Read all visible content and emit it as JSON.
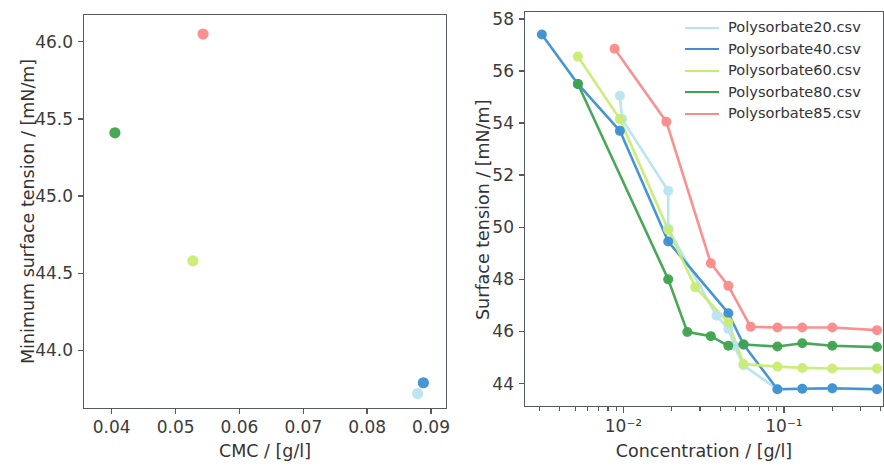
{
  "figure": {
    "background": "#ffffff",
    "axis_color": "#555a5e",
    "text_color": "#333333"
  },
  "series_colors": {
    "Polysorbate20": "#b8e4f0",
    "Polysorbate40": "#3d8fd1",
    "Polysorbate60": "#c8ec72",
    "Polysorbate80": "#3fa34d",
    "Polysorbate85": "#f98b8b"
  },
  "left_panel": {
    "x_title": "CMC / [g/l]",
    "y_title": "Minimum surface tension / [mN/m]",
    "x_ticks": [
      "0.04",
      "0.05",
      "0.06",
      "0.07",
      "0.08",
      "0.09"
    ],
    "y_ticks": [
      "44.0",
      "44.5",
      "45.0",
      "45.5",
      "46.0"
    ]
  },
  "right_panel": {
    "x_title": "Concentration / [g/l]",
    "y_title": "Surface tension / [mN/m]",
    "x_ticks": [
      "10⁻²",
      "10⁻¹"
    ],
    "y_ticks": [
      "44",
      "46",
      "48",
      "50",
      "52",
      "54",
      "56",
      "58"
    ],
    "legend": [
      {
        "label": "Polysorbate20.csv",
        "color": "#b8e4f0"
      },
      {
        "label": "Polysorbate40.csv",
        "color": "#3d8fd1"
      },
      {
        "label": "Polysorbate60.csv",
        "color": "#c8ec72"
      },
      {
        "label": "Polysorbate80.csv",
        "color": "#3fa34d"
      },
      {
        "label": "Polysorbate85.csv",
        "color": "#f98b8b"
      }
    ]
  },
  "chart_data": [
    {
      "type": "scatter",
      "panel": "left",
      "title": "",
      "xlabel": "CMC / [g/l]",
      "ylabel": "Minimum surface tension / [mN/m]",
      "xscale": "linear",
      "yscale": "linear",
      "xlim": [
        0.0355,
        0.0925
      ],
      "ylim": [
        43.62,
        46.18
      ],
      "xticks": [
        0.04,
        0.05,
        0.06,
        0.07,
        0.08,
        0.09
      ],
      "yticks": [
        44.0,
        44.5,
        45.0,
        45.5,
        46.0
      ],
      "grid": false,
      "legend": "none",
      "points": [
        {
          "name": "Polysorbate80",
          "x": 0.0405,
          "y": 45.41,
          "color": "#3fa34d"
        },
        {
          "name": "Polysorbate60",
          "x": 0.0527,
          "y": 44.58,
          "color": "#c8ec72"
        },
        {
          "name": "Polysorbate85",
          "x": 0.0543,
          "y": 46.05,
          "color": "#f98b8b"
        },
        {
          "name": "Polysorbate20",
          "x": 0.0879,
          "y": 43.72,
          "color": "#b8e4f0"
        },
        {
          "name": "Polysorbate40",
          "x": 0.0888,
          "y": 43.79,
          "color": "#3d8fd1"
        }
      ]
    },
    {
      "type": "line",
      "panel": "right",
      "title": "",
      "xlabel": "Concentration / [g/l]",
      "ylabel": "Surface tension / [mN/m]",
      "xscale": "log",
      "yscale": "linear",
      "xlim": [
        0.0024,
        0.42
      ],
      "ylim": [
        43.1,
        58.3
      ],
      "xticks": [
        0.01,
        0.1
      ],
      "xtick_labels": [
        "10⁻²",
        "10⁻¹"
      ],
      "yticks": [
        44,
        46,
        48,
        50,
        52,
        54,
        56,
        58
      ],
      "grid": false,
      "legend": "upper right",
      "markers": "circle",
      "series": [
        {
          "name": "Polysorbate20.csv",
          "color": "#b8e4f0",
          "x": [
            0.0095,
            0.0098,
            0.019,
            0.019,
            0.038,
            0.045,
            0.049,
            0.056,
            0.091,
            0.13,
            0.2,
            0.38
          ],
          "y": [
            55.05,
            54.15,
            51.4,
            49.95,
            46.6,
            46.1,
            45.45,
            44.7,
            43.78,
            43.8,
            43.8,
            43.78
          ]
        },
        {
          "name": "Polysorbate40.csv",
          "color": "#3d8fd1",
          "x": [
            0.0031,
            0.0052,
            0.0095,
            0.019,
            0.045,
            0.056,
            0.091,
            0.13,
            0.2,
            0.38
          ],
          "y": [
            57.4,
            55.5,
            53.7,
            49.45,
            46.7,
            45.5,
            43.78,
            43.8,
            43.82,
            43.78
          ]
        },
        {
          "name": "Polysorbate60.csv",
          "color": "#c8ec72",
          "x": [
            0.0052,
            0.0095,
            0.019,
            0.028,
            0.045,
            0.056,
            0.091,
            0.13,
            0.2,
            0.38
          ],
          "y": [
            56.55,
            54.15,
            49.9,
            47.7,
            46.35,
            44.75,
            44.65,
            44.6,
            44.58,
            44.58
          ]
        },
        {
          "name": "Polysorbate80.csv",
          "color": "#3fa34d",
          "x": [
            0.0052,
            0.019,
            0.025,
            0.035,
            0.045,
            0.056,
            0.091,
            0.13,
            0.2,
            0.38
          ],
          "y": [
            55.5,
            48.0,
            45.98,
            45.82,
            45.45,
            45.5,
            45.42,
            45.55,
            45.45,
            45.4
          ]
        },
        {
          "name": "Polysorbate85.csv",
          "color": "#f98b8b",
          "x": [
            0.0088,
            0.0185,
            0.035,
            0.045,
            0.062,
            0.091,
            0.13,
            0.2,
            0.38
          ],
          "y": [
            56.85,
            54.05,
            48.62,
            47.75,
            46.18,
            46.15,
            46.15,
            46.15,
            46.05
          ]
        }
      ]
    }
  ]
}
